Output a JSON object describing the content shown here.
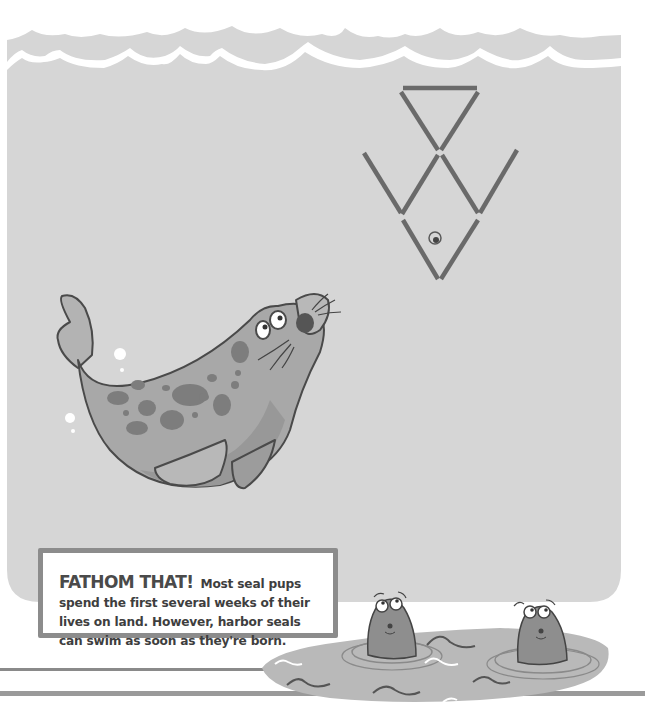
{
  "fact": {
    "title": "FATHOM THAT!",
    "body": "Most seal pups spend the first several weeks of their lives on land. However, harbor seals can swim as soon as they're born."
  },
  "illustration": {
    "water_color": "#d6d6d6",
    "puzzle": "matchstick-fish",
    "matchstick_count": 8,
    "seals_swimming": 1,
    "seals_in_pond": 2
  },
  "colors": {
    "water": "#d6d6d6",
    "stick": "#6e6e6e",
    "seal_body": "#a9a9a9",
    "seal_spot": "#7d7d7d",
    "border": "#8c8c8c",
    "pond": "#b9b9b9"
  }
}
